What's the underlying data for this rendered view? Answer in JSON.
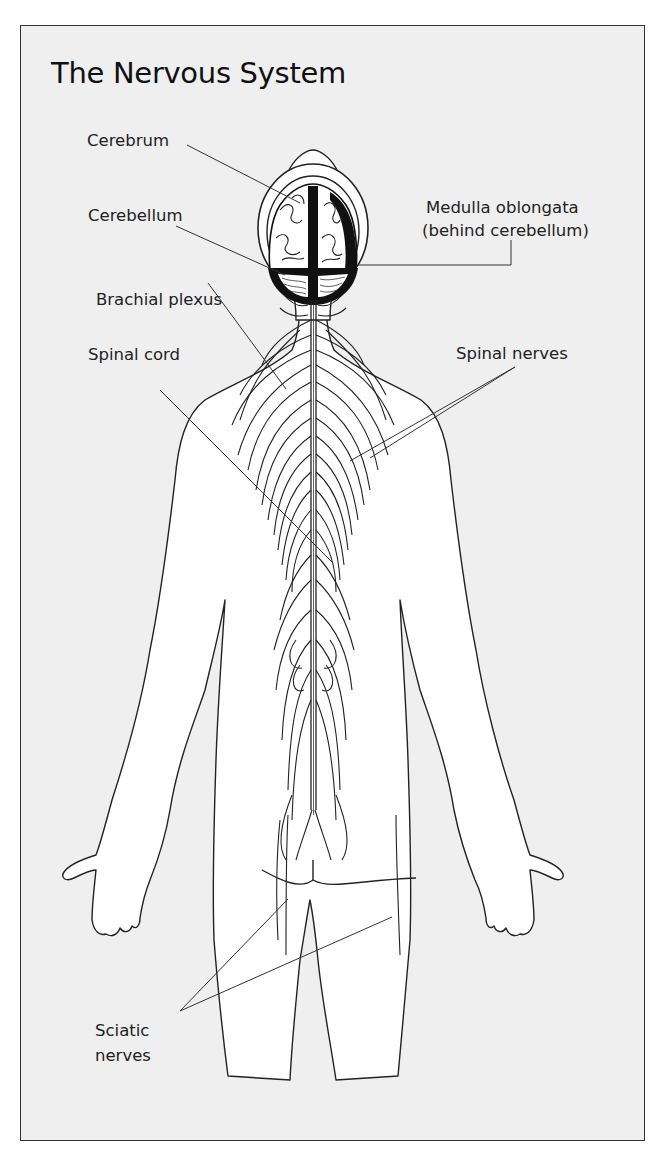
{
  "diagram": {
    "title": "The Nervous System",
    "labels": {
      "cerebrum": "Cerebrum",
      "cerebellum": "Cerebellum",
      "medulla_line1": "Medulla oblongata",
      "medulla_line2": "(behind cerebellum)",
      "brachial_plexus": "Brachial plexus",
      "spinal_cord": "Spinal cord",
      "spinal_nerves": "Spinal nerves",
      "sciatic_line1": "Sciatic",
      "sciatic_line2": "nerves"
    },
    "view": "posterior human figure outline with brain, spinal cord and nerves",
    "colors": {
      "background": "#efefef",
      "body_fill": "#ffffff",
      "line": "#222222",
      "brain_dark": "#111111"
    }
  }
}
